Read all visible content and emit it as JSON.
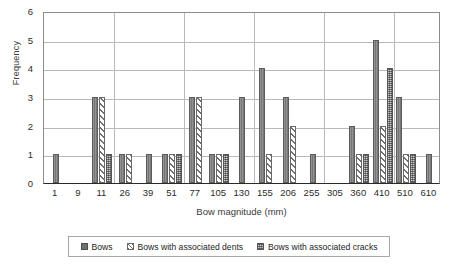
{
  "chart_data": {
    "type": "bar",
    "title": "",
    "xlabel": "Bow magnitude (mm)",
    "ylabel": "Frequency",
    "categories": [
      "1",
      "9",
      "11",
      "26",
      "39",
      "51",
      "77",
      "105",
      "130",
      "155",
      "206",
      "255",
      "305",
      "360",
      "410",
      "510",
      "610"
    ],
    "series": [
      {
        "name": "Bows",
        "values": [
          1,
          0,
          3,
          1,
          1,
          1,
          3,
          1,
          3,
          4,
          3,
          1,
          0,
          2,
          5,
          3,
          1
        ]
      },
      {
        "name": "Bows with associated dents",
        "values": [
          0,
          0,
          3,
          1,
          0,
          1,
          3,
          1,
          0,
          1,
          2,
          0,
          0,
          1,
          2,
          1,
          0
        ]
      },
      {
        "name": "Bows with associated cracks",
        "values": [
          0,
          0,
          1,
          0,
          0,
          1,
          0,
          1,
          0,
          0,
          0,
          0,
          0,
          1,
          4,
          1,
          0
        ]
      }
    ],
    "ylim": [
      0,
      6
    ],
    "yticks": [
      "0",
      "1",
      "2",
      "3",
      "4",
      "5",
      "6"
    ],
    "grid": true,
    "legend_position": "bottom",
    "colors": {
      "series_bows": "#777777",
      "series_dents": "#ffffff",
      "series_cracks": "#8a8a8a",
      "gridline": "#b9b9b9",
      "axis": "#2a2a2a",
      "background": "#ffffff"
    }
  }
}
